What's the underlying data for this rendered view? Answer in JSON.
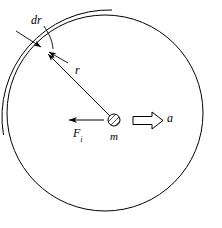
{
  "figure": {
    "type": "physics-free-body-diagram",
    "background_color": "#ffffff",
    "stroke_color": "#000000",
    "width": 222,
    "height": 228,
    "labels": {
      "shell_thickness": "dr",
      "radius": "r",
      "mass": "m",
      "acceleration": "a",
      "internal_force": "F",
      "internal_force_subscript": "i"
    },
    "elements": {
      "main_circle": {
        "name": "main-circle",
        "center_x": 105,
        "center_y": 113,
        "radius": 98
      },
      "outer_arc": {
        "name": "outer-shell-arc",
        "center_x": 109,
        "center_y": 117,
        "radius": 107,
        "start_angle_deg": 175,
        "end_angle_deg": 268
      },
      "mass_particle": {
        "name": "mass-particle",
        "center_x": 114,
        "center_y": 120,
        "radius": 6,
        "hatched": true
      },
      "radius_line": {
        "name": "radius-line",
        "from_x": 114,
        "from_y": 120,
        "to_x": 46,
        "to_y": 52
      },
      "acceleration_arrow": {
        "name": "acceleration-block-arrow",
        "x": 133,
        "y": 113,
        "width": 30,
        "height": 15,
        "direction": "right",
        "filled": false
      },
      "force_arrow": {
        "name": "internal-force-arrow",
        "from_x": 103,
        "from_y": 120,
        "to_x": 68,
        "to_y": 120,
        "direction": "left"
      },
      "dr_leader": {
        "name": "dr-leader-line",
        "from_x": 45,
        "from_y": 27,
        "to_x": 52,
        "to_y": 47
      },
      "dr_arrow_upper": {
        "name": "dr-upper-arrow",
        "from_x": 17,
        "from_y": 32,
        "to_x": 40,
        "to_y": 46
      },
      "dr_arrow_lower": {
        "name": "dr-lower-arrow",
        "from_x": 67,
        "from_y": 62,
        "to_x": 48,
        "to_y": 51
      }
    }
  }
}
